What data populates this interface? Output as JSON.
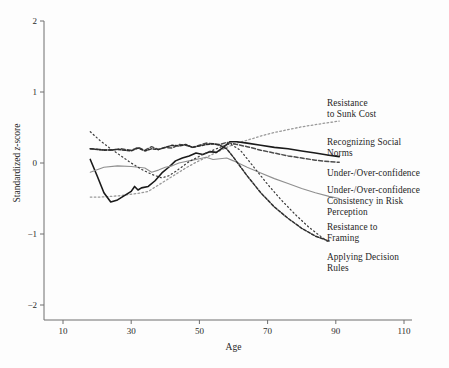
{
  "figure": {
    "background_color": "#fdfdfd",
    "axis_color": "#6e6e6e",
    "text_color": "#1f1f1f"
  },
  "chart_data": {
    "type": "line",
    "title": "",
    "xlabel": "Age",
    "ylabel": "Standardized z-score",
    "xlim": [
      10,
      110
    ],
    "ylim": [
      -2,
      2
    ],
    "xticks": [
      10,
      30,
      50,
      70,
      90,
      110
    ],
    "yticks": [
      2,
      1,
      0,
      -1,
      -2
    ],
    "xtick_labels": [
      "10",
      "30",
      "50",
      "70",
      "90",
      "110"
    ],
    "ytick_labels": [
      "2",
      "1",
      "0",
      "-1",
      "-2"
    ],
    "grid": false,
    "legend_position": "right-of-axes",
    "series": [
      {
        "name": "Resistance to Sunk Cost",
        "color": "#9a9a9a",
        "style": "dotted",
        "width": 1.3,
        "x": [
          18,
          21,
          24,
          27,
          30,
          33,
          35,
          37,
          40,
          43,
          46,
          49,
          52,
          55,
          58,
          61,
          64,
          68,
          72,
          76,
          80,
          84,
          88,
          91
        ],
        "y": [
          -0.48,
          -0.48,
          -0.47,
          -0.46,
          -0.44,
          -0.42,
          -0.4,
          -0.34,
          -0.25,
          -0.16,
          -0.07,
          0.01,
          0.08,
          0.15,
          0.22,
          0.28,
          0.32,
          0.38,
          0.43,
          0.47,
          0.51,
          0.54,
          0.57,
          0.59
        ]
      },
      {
        "name": "Recognizing Social Norms",
        "color": "#1a1a1a",
        "style": "solid",
        "width": 1.6,
        "x": [
          18,
          20,
          22,
          24,
          26,
          28,
          30,
          31,
          32,
          33,
          35,
          37,
          39,
          41,
          43,
          45,
          47,
          49,
          51,
          53,
          55,
          57,
          59,
          61,
          64,
          68,
          72,
          76,
          80,
          84,
          88,
          91
        ],
        "y": [
          0.05,
          -0.18,
          -0.42,
          -0.55,
          -0.52,
          -0.46,
          -0.4,
          -0.33,
          -0.38,
          -0.35,
          -0.33,
          -0.25,
          -0.14,
          -0.06,
          0.03,
          0.07,
          0.1,
          0.14,
          0.12,
          0.16,
          0.15,
          0.22,
          0.3,
          0.3,
          0.28,
          0.25,
          0.22,
          0.2,
          0.17,
          0.14,
          0.11,
          0.09
        ]
      },
      {
        "name": "Under-/Over-confidence",
        "color": "#4c4c4c",
        "style": "dashed",
        "width": 1.5,
        "x": [
          18,
          21,
          24,
          27,
          30,
          32,
          34,
          36,
          38,
          40,
          42,
          44,
          46,
          48,
          50,
          52,
          54,
          56,
          58,
          60,
          64,
          68,
          72,
          76,
          80,
          84,
          88,
          91
        ],
        "y": [
          0.2,
          0.19,
          0.18,
          0.2,
          0.18,
          0.22,
          0.18,
          0.23,
          0.19,
          0.22,
          0.21,
          0.26,
          0.25,
          0.22,
          0.25,
          0.28,
          0.27,
          0.26,
          0.29,
          0.27,
          0.23,
          0.18,
          0.14,
          0.1,
          0.07,
          0.04,
          0.02,
          0.01
        ]
      },
      {
        "name": "Under-/Over-confidence Consistency in Risk Perception",
        "color": "#8f8f8f",
        "style": "solid",
        "width": 1.1,
        "x": [
          18,
          22,
          26,
          30,
          34,
          36,
          38,
          40,
          42,
          44,
          46,
          48,
          50,
          52,
          54,
          56,
          58,
          60,
          64,
          68,
          72,
          76,
          80,
          84,
          88,
          91
        ],
        "y": [
          -0.13,
          -0.06,
          -0.04,
          -0.05,
          -0.07,
          -0.13,
          -0.1,
          -0.06,
          -0.04,
          0.0,
          0.02,
          0.04,
          0.06,
          0.08,
          0.05,
          0.06,
          0.07,
          0.03,
          -0.06,
          -0.14,
          -0.22,
          -0.29,
          -0.36,
          -0.42,
          -0.47,
          -0.5
        ]
      },
      {
        "name": "Resistance to Framing",
        "color": "#2c2c2c",
        "style": "dashed-dense",
        "width": 1.5,
        "x": [
          18,
          22,
          26,
          30,
          32,
          34,
          36,
          38,
          40,
          42,
          44,
          46,
          48,
          50,
          52,
          54,
          56,
          58,
          60,
          64,
          68,
          72,
          76,
          80,
          84,
          88
        ],
        "y": [
          0.2,
          0.18,
          0.19,
          0.17,
          0.21,
          0.17,
          0.2,
          0.19,
          0.22,
          0.25,
          0.24,
          0.26,
          0.22,
          0.24,
          0.26,
          0.27,
          0.25,
          0.2,
          0.08,
          -0.18,
          -0.42,
          -0.62,
          -0.78,
          -0.92,
          -1.03,
          -1.1
        ]
      },
      {
        "name": "Applying Decision Rules",
        "color": "#3a3a3a",
        "style": "dotted-sparse",
        "width": 1.2,
        "x": [
          18,
          21,
          24,
          27,
          30,
          33,
          36,
          39,
          41,
          43,
          45,
          47,
          49,
          51,
          53,
          55,
          57,
          59,
          62,
          66,
          70,
          74,
          78,
          82,
          86,
          88
        ],
        "y": [
          0.44,
          0.31,
          0.2,
          0.1,
          0.0,
          -0.09,
          -0.16,
          -0.21,
          -0.18,
          -0.12,
          -0.05,
          0.02,
          0.07,
          0.12,
          0.16,
          0.2,
          0.24,
          0.27,
          0.18,
          -0.06,
          -0.3,
          -0.52,
          -0.72,
          -0.9,
          -1.05,
          -1.12
        ]
      }
    ],
    "legend_entries": [
      {
        "label": "Resistance\nto Sunk Cost",
        "series": "Resistance to Sunk Cost"
      },
      {
        "label": "Recognizing Social\nNorms",
        "series": "Recognizing Social Norms"
      },
      {
        "label": "Under-/Over-confidence",
        "series": "Under-/Over-confidence"
      },
      {
        "label": "Under-/Over-confidence\nConsistency in Risk\nPerception",
        "series": "Under-/Over-confidence Consistency in Risk Perception"
      },
      {
        "label": "Resistance to\nFraming",
        "series": "Resistance to Framing"
      },
      {
        "label": "Applying Decision\nRules",
        "series": "Applying Decision Rules"
      }
    ]
  }
}
